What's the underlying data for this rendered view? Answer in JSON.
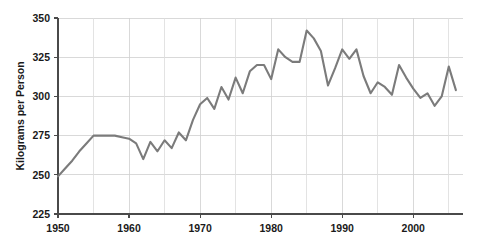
{
  "chart_data": {
    "type": "line",
    "title": "",
    "xlabel": "",
    "ylabel": "Kilograms per Person",
    "xlim": [
      1950,
      2007
    ],
    "ylim": [
      225,
      350
    ],
    "ytick_labels": [
      "225",
      "250",
      "275",
      "300",
      "325",
      "350"
    ],
    "ytick_values": [
      225,
      250,
      275,
      300,
      325,
      350
    ],
    "xtick_labels": [
      "1950",
      "1960",
      "1970",
      "1980",
      "1990",
      "2000"
    ],
    "xtick_values": [
      1950,
      1960,
      1970,
      1980,
      1990,
      2000
    ],
    "xminor_values": [
      1955,
      1965,
      1975,
      1985,
      1995,
      2005
    ],
    "grid": true,
    "legend": "none",
    "line_color": "#7b7b7b",
    "grid_color": "#cfcfcf",
    "axis_color": "#4a4a4a",
    "series": [
      {
        "name": "Kilograms per Person",
        "x": [
          1950,
          1951,
          1952,
          1953,
          1954,
          1955,
          1956,
          1957,
          1958,
          1959,
          1960,
          1961,
          1962,
          1963,
          1964,
          1965,
          1966,
          1967,
          1968,
          1969,
          1970,
          1971,
          1972,
          1973,
          1974,
          1975,
          1976,
          1977,
          1978,
          1979,
          1980,
          1981,
          1982,
          1983,
          1984,
          1985,
          1986,
          1987,
          1988,
          1989,
          1990,
          1991,
          1992,
          1993,
          1994,
          1995,
          1996,
          1997,
          1998,
          1999,
          2000,
          2001,
          2002,
          2003,
          2004,
          2005,
          2006
        ],
        "values": [
          249,
          254,
          259,
          265,
          270,
          275,
          275,
          275,
          275,
          274,
          273,
          270,
          260,
          271,
          265,
          272,
          267,
          277,
          272,
          285,
          295,
          299,
          292,
          306,
          298,
          312,
          302,
          316,
          320,
          320,
          311,
          330,
          325,
          322,
          322,
          342,
          337,
          329,
          307,
          318,
          330,
          324,
          330,
          313,
          302,
          309,
          306,
          301,
          320,
          312,
          305,
          299,
          302,
          294,
          300,
          319,
          304
        ]
      }
    ]
  }
}
